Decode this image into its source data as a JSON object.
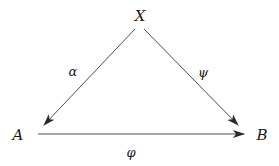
{
  "diagram": {
    "type": "commutative-triangle",
    "colors": {
      "stroke": "#3a3a3a",
      "text": "#1a1a1a",
      "background": "#ffffff"
    },
    "nodes": {
      "X": {
        "label": "X"
      },
      "A": {
        "label": "A"
      },
      "B": {
        "label": "B"
      }
    },
    "edges": {
      "alpha": {
        "label": "α",
        "from": "X",
        "to": "A"
      },
      "psi": {
        "label": "ψ",
        "from": "X",
        "to": "B"
      },
      "phi": {
        "label": "φ",
        "from": "A",
        "to": "B"
      }
    }
  }
}
